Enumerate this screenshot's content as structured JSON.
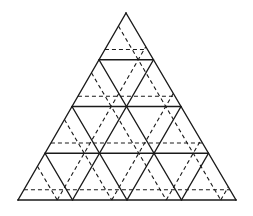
{
  "diagram": {
    "outer_triangle": {
      "apex": [
        126,
        13
      ],
      "base_left": [
        18,
        200
      ],
      "base_right": [
        236,
        200
      ]
    },
    "rows": 4,
    "solid_horizontal_y": [
      60,
      107,
      153
    ],
    "dashed_horizontal_y": [
      50,
      88,
      125,
      161
    ],
    "note": "Dashed-lattice positions are measured/approximated; exact construction rule not confirmed",
    "stroke_color": "#1a1a1a",
    "background_color": "#ffffff"
  }
}
